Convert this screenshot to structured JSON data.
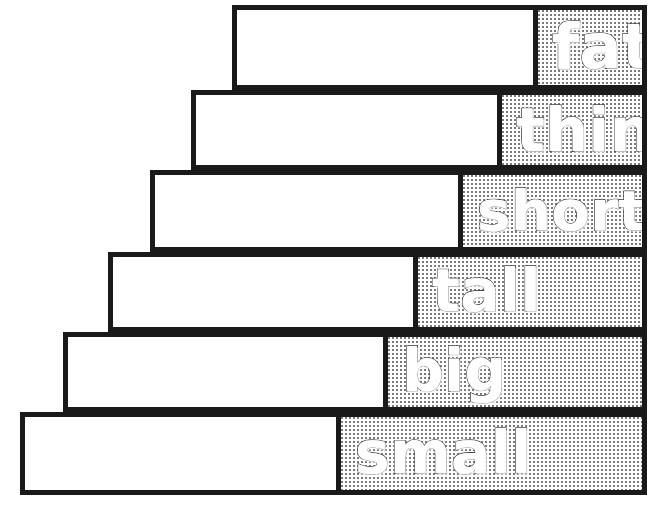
{
  "diagram": {
    "canvas": {
      "width": 663,
      "height": 518
    },
    "ink_color": "#1a1a1a",
    "fill_color": "#ffffff",
    "stipple_color": "#7a7a7a",
    "word_outline_color": "#4a4a4a",
    "steps": [
      {
        "label": "fat",
        "order": 1,
        "left": 232,
        "top": 5,
        "right": 647,
        "bottom": 90,
        "label_cell_left": 533,
        "font_size": 62
      },
      {
        "label": "thin",
        "order": 2,
        "left": 191,
        "top": 90,
        "right": 647,
        "bottom": 170,
        "label_cell_left": 497,
        "font_size": 60
      },
      {
        "label": "short",
        "order": 3,
        "left": 150,
        "top": 170,
        "right": 647,
        "bottom": 252,
        "label_cell_left": 458,
        "font_size": 56
      },
      {
        "label": "tall",
        "order": 4,
        "left": 108,
        "top": 252,
        "right": 647,
        "bottom": 332,
        "label_cell_left": 413,
        "font_size": 58
      },
      {
        "label": "big",
        "order": 5,
        "left": 63,
        "top": 332,
        "right": 647,
        "bottom": 412,
        "label_cell_left": 383,
        "font_size": 58
      },
      {
        "label": "small",
        "order": 6,
        "left": 20,
        "top": 412,
        "right": 647,
        "bottom": 495,
        "label_cell_left": 336,
        "font_size": 58
      }
    ]
  }
}
